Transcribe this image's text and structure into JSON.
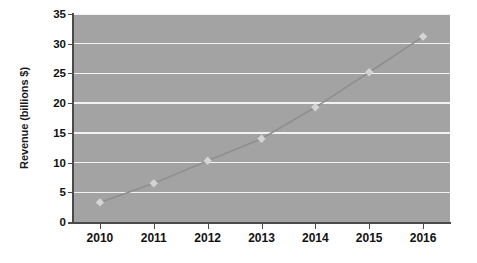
{
  "chart_data": {
    "type": "line",
    "title": "",
    "xlabel": "",
    "ylabel": "Revenue (billions $)",
    "categories": [
      "2010",
      "2011",
      "2012",
      "2013",
      "2014",
      "2015",
      "2016"
    ],
    "x": [
      2010,
      2011,
      2012,
      2013,
      2014,
      2015,
      2016
    ],
    "values": [
      3.3,
      6.5,
      10.3,
      14.0,
      19.3,
      25.2,
      31.2
    ],
    "series": [
      {
        "name": "Revenue",
        "values": [
          3.3,
          6.5,
          10.3,
          14.0,
          19.3,
          25.2,
          31.2
        ],
        "marker": "diamond",
        "line_color": "#8f8f8f",
        "marker_color": "#d4d4d4"
      }
    ],
    "ylim": [
      0,
      35
    ],
    "yticks": [
      0,
      5,
      10,
      15,
      20,
      25,
      30,
      35
    ],
    "ytick_labels": [
      "0",
      "5",
      "10",
      "15",
      "20",
      "25",
      "30",
      "35"
    ],
    "grid": "horizontal",
    "legend": "none",
    "plot_background": "#a3a3a3",
    "gridline_color": "#f2f2f2",
    "axis_color": "#4a4a4a",
    "figure_background": "#ffffff"
  }
}
